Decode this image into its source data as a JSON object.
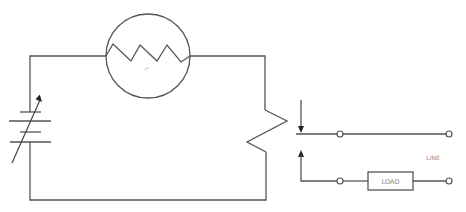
{
  "diagram": {
    "type": "electrical-schematic",
    "components": {
      "battery": {
        "kind": "variable-voltage-source"
      },
      "heater_element": {
        "kind": "resistor-in-circle",
        "label": "r°"
      },
      "bimetal_coil": {
        "kind": "zigzag-resistor"
      },
      "relay_contacts": {
        "kind": "movable-contacts"
      },
      "load": {
        "kind": "load-box",
        "label": "LOAD"
      },
      "line": {
        "label": "LINE"
      }
    },
    "colors": {
      "stroke": "#555555",
      "text": "#8a8a8a"
    }
  }
}
